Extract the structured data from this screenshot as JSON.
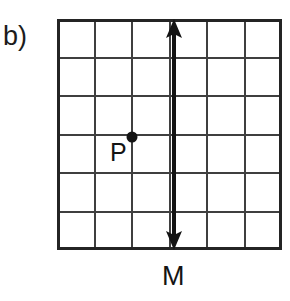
{
  "figure": {
    "part_label": "b)",
    "background_color": "#ffffff",
    "grid": {
      "columns": 6,
      "rows": 6,
      "line_color": "#3a3a3a",
      "border_color": "#262626",
      "cell_width": 37.5,
      "cell_height": 38.5,
      "origin_x": 57,
      "origin_y": 19,
      "width": 225,
      "height": 231
    },
    "point": {
      "label": "P",
      "name": "point-p",
      "color": "#141414",
      "grid_x": 3,
      "grid_y": 3,
      "pixel_x": 132,
      "pixel_y": 137,
      "radius": 5
    },
    "line": {
      "label": "M",
      "name": "line-m",
      "orientation": "vertical",
      "color": "#131313",
      "stroke_width": 4,
      "grid_x": 4,
      "pixel_x": 174,
      "top_y": 19,
      "bottom_y": 249,
      "arrowheads": "both",
      "arrowhead_width": 16,
      "arrowhead_height": 15
    }
  }
}
